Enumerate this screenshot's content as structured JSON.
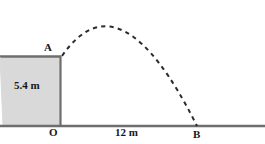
{
  "figure": {
    "type": "projectile-motion-diagram",
    "labels": {
      "launch_point": "A",
      "origin": "O",
      "landing_point": "B",
      "height": "5.4 m",
      "range": "12 m"
    },
    "colors": {
      "ramp_fill": "#d9d9d9",
      "line": "#6e6e6e",
      "ground": "#6e6e6e",
      "trajectory": "#2b2b2b",
      "text": "#171717",
      "background": "#ffffff"
    },
    "geometry": {
      "ground_y": 126,
      "wall_x": 60,
      "ramp_top_y": 56,
      "ramp_left_x": 0,
      "trajectory_start": [
        62,
        56
      ],
      "trajectory_apex": [
        120,
        8
      ],
      "trajectory_end": [
        197,
        126
      ],
      "canvas_width": 265,
      "canvas_height": 144
    }
  }
}
